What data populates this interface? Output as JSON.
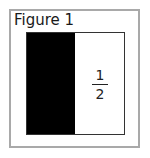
{
  "figure": {
    "title": "Figure 1",
    "regions": [
      {
        "name": "shaded-half",
        "color": "#000000"
      },
      {
        "name": "unshaded-half",
        "color": "#ffffff"
      }
    ],
    "label": {
      "numerator": "1",
      "denominator": "2"
    }
  }
}
